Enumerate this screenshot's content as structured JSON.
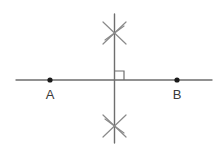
{
  "figure": {
    "background_color": "#ffffff",
    "stroke_color": "#6e6e6e",
    "dot_color": "#1a1a1a",
    "label_color": "#3a3a3a"
  },
  "labels": {
    "point_a": "A",
    "point_b": "B"
  },
  "geometry": {
    "canvas": {
      "width": 223,
      "height": 146
    },
    "horizontal_line": {
      "x1": 16,
      "y1": 80,
      "x2": 212,
      "y2": 80,
      "stroke_width": 1.4
    },
    "vertical_line": {
      "x1": 114.5,
      "y1": 14,
      "x2": 114.5,
      "y2": 143,
      "stroke_width": 1.4
    },
    "intersection": {
      "x": 114.5,
      "y": 80
    },
    "right_angle_mark": {
      "x": 115,
      "y": 71,
      "size": 9,
      "quadrant": "upper-right",
      "stroke_width": 1.2
    },
    "points": [
      {
        "name": "A",
        "cx": 50,
        "cy": 80,
        "r": 2.6,
        "label_x": 50,
        "label_y": 99
      },
      {
        "name": "B",
        "cx": 177,
        "cy": 80,
        "r": 2.6,
        "label_x": 177,
        "label_y": 99
      }
    ],
    "arc_marks": [
      {
        "name": "upper-arc-intersection",
        "center_x": 114.5,
        "center_y": 33,
        "strokes": [
          {
            "x1": 103,
            "y1": 22,
            "x2": 126,
            "y2": 44
          },
          {
            "x1": 126,
            "y1": 22,
            "x2": 103,
            "y2": 44
          },
          {
            "x1": 105,
            "y1": 40,
            "x2": 124,
            "y2": 26
          }
        ],
        "stroke_width": 1.2
      },
      {
        "name": "lower-arc-intersection",
        "center_x": 114.5,
        "center_y": 126,
        "strokes": [
          {
            "x1": 103,
            "y1": 115,
            "x2": 126,
            "y2": 137
          },
          {
            "x1": 126,
            "y1": 115,
            "x2": 103,
            "y2": 137
          },
          {
            "x1": 105,
            "y1": 119,
            "x2": 124,
            "y2": 133
          }
        ],
        "stroke_width": 1.2
      }
    ]
  }
}
